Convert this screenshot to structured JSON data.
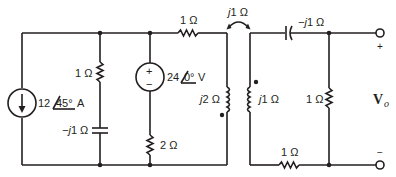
{
  "diagram": {
    "type": "circuit-schematic",
    "components": {
      "current_source": {
        "magnitude": "12",
        "angle": "45°",
        "unit": "A"
      },
      "r_shunt_top": {
        "value": "1 Ω"
      },
      "c_shunt": {
        "prefix": "−j",
        "value": "1 Ω"
      },
      "voltage_source": {
        "magnitude": "24",
        "angle": "0°",
        "unit": "V",
        "plus": "+",
        "minus": "−"
      },
      "r_series_source": {
        "value": "2 Ω"
      },
      "r_top": {
        "value": "1 Ω"
      },
      "mutual": {
        "prefix": "j",
        "value": "1 Ω"
      },
      "l_primary": {
        "prefix": "j",
        "value": "2 Ω"
      },
      "l_secondary": {
        "prefix": "j",
        "value": "1 Ω"
      },
      "c_series": {
        "prefix": "−j",
        "value": "1 Ω"
      },
      "r_load": {
        "value": "1 Ω"
      },
      "r_bottom": {
        "value": "1 Ω"
      }
    },
    "output": {
      "symbol": "V",
      "subscript": "o",
      "plus": "+",
      "minus": "−"
    }
  }
}
